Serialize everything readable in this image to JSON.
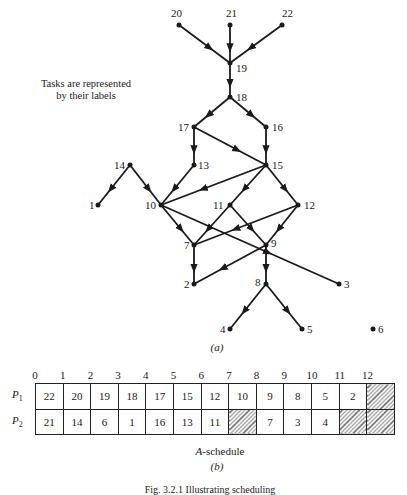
{
  "note": {
    "line1": "Tasks are represented",
    "line2": "by their labels"
  },
  "graph": {
    "caption": "(a)",
    "nodes": [
      {
        "id": "20",
        "x": 179,
        "y": 25,
        "lx": -8,
        "ly": -8
      },
      {
        "id": "21",
        "x": 230,
        "y": 25,
        "lx": -4,
        "ly": -8
      },
      {
        "id": "22",
        "x": 282,
        "y": 25,
        "lx": 0,
        "ly": -8
      },
      {
        "id": "19",
        "x": 230,
        "y": 63,
        "lx": 6,
        "ly": 9
      },
      {
        "id": "18",
        "x": 230,
        "y": 97,
        "lx": 6,
        "ly": 4
      },
      {
        "id": "17",
        "x": 194,
        "y": 127,
        "lx": -16,
        "ly": 4
      },
      {
        "id": "16",
        "x": 266,
        "y": 127,
        "lx": 6,
        "ly": 4
      },
      {
        "id": "14",
        "x": 130,
        "y": 165,
        "lx": -16,
        "ly": 4
      },
      {
        "id": "13",
        "x": 194,
        "y": 165,
        "lx": 4,
        "ly": 4
      },
      {
        "id": "15",
        "x": 266,
        "y": 165,
        "lx": 6,
        "ly": 4
      },
      {
        "id": "1",
        "x": 98,
        "y": 205,
        "lx": -9,
        "ly": 4
      },
      {
        "id": "10",
        "x": 161,
        "y": 205,
        "lx": -16,
        "ly": 4
      },
      {
        "id": "11",
        "x": 230,
        "y": 205,
        "lx": -17,
        "ly": 4
      },
      {
        "id": "12",
        "x": 298,
        "y": 205,
        "lx": 6,
        "ly": 4
      },
      {
        "id": "7",
        "x": 194,
        "y": 245,
        "lx": -10,
        "ly": 4
      },
      {
        "id": "9",
        "x": 266,
        "y": 245,
        "lx": 5,
        "ly": 2
      },
      {
        "id": "2",
        "x": 194,
        "y": 284,
        "lx": -10,
        "ly": 4
      },
      {
        "id": "8",
        "x": 266,
        "y": 284,
        "lx": -11,
        "ly": 2
      },
      {
        "id": "3",
        "x": 339,
        "y": 284,
        "lx": 5,
        "ly": 4
      },
      {
        "id": "4",
        "x": 230,
        "y": 329,
        "lx": -10,
        "ly": 4
      },
      {
        "id": "5",
        "x": 302,
        "y": 329,
        "lx": 5,
        "ly": 4
      },
      {
        "id": "6",
        "x": 373,
        "y": 329,
        "lx": 5,
        "ly": 4
      }
    ],
    "edges": [
      [
        "20",
        "19"
      ],
      [
        "21",
        "19"
      ],
      [
        "22",
        "19"
      ],
      [
        "19",
        "18"
      ],
      [
        "18",
        "17"
      ],
      [
        "18",
        "16"
      ],
      [
        "17",
        "13"
      ],
      [
        "17",
        "15"
      ],
      [
        "16",
        "15"
      ],
      [
        "14",
        "1"
      ],
      [
        "14",
        "10"
      ],
      [
        "13",
        "10"
      ],
      [
        "15",
        "10"
      ],
      [
        "15",
        "11"
      ],
      [
        "15",
        "12"
      ],
      [
        "10",
        "7"
      ],
      [
        "10",
        "3"
      ],
      [
        "11",
        "7"
      ],
      [
        "11",
        "9"
      ],
      [
        "12",
        "7"
      ],
      [
        "12",
        "9"
      ],
      [
        "7",
        "2"
      ],
      [
        "9",
        "2"
      ],
      [
        "9",
        "8"
      ],
      [
        "8",
        "4"
      ],
      [
        "8",
        "5"
      ]
    ]
  },
  "schedule": {
    "title_italic": "A",
    "title_rest": "-schedule",
    "caption": "(b)",
    "time_ticks": [
      "0",
      "1",
      "2",
      "3",
      "4",
      "5",
      "6",
      "7",
      "8",
      "9",
      "10",
      "11",
      "12"
    ],
    "rows": [
      {
        "label": "P",
        "sub": "1",
        "cells": [
          "22",
          "20",
          "19",
          "18",
          "17",
          "15",
          "12",
          "10",
          "9",
          "8",
          "5",
          "2",
          ""
        ],
        "idle": [
          false,
          false,
          false,
          false,
          false,
          false,
          false,
          false,
          false,
          false,
          false,
          false,
          true
        ]
      },
      {
        "label": "P",
        "sub": "2",
        "cells": [
          "21",
          "14",
          "6",
          "1",
          "16",
          "13",
          "11",
          "",
          "7",
          "3",
          "4",
          "",
          ""
        ],
        "idle": [
          false,
          false,
          false,
          false,
          false,
          false,
          false,
          true,
          false,
          false,
          false,
          true,
          true
        ]
      }
    ]
  },
  "figure_caption": "Fig. 3.2.1  Illustrating scheduling"
}
